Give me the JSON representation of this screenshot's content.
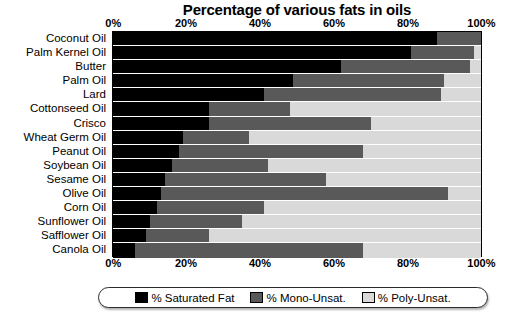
{
  "chart_data": {
    "type": "bar",
    "orientation": "horizontal",
    "stacked": true,
    "percent_stacked": true,
    "title": "Percentage of various fats in oils",
    "xlabel": "",
    "ylabel": "",
    "xlim": [
      0,
      100
    ],
    "grid": true,
    "legend_position": "bottom",
    "xticks": [
      "0%",
      "20%",
      "40%",
      "60%",
      "80%",
      "100%"
    ],
    "xtick_values": [
      0,
      20,
      40,
      60,
      80,
      100
    ],
    "categories": [
      "Coconut Oil",
      "Palm Kernel Oil",
      "Butter",
      "Palm Oil",
      "Lard",
      "Cottonseed Oil",
      "Crisco",
      "Wheat Germ Oil",
      "Peanut Oil",
      "Soybean Oil",
      "Sesame Oil",
      "Olive Oil",
      "Corn Oil",
      "Sunflower Oil",
      "Safflower Oil",
      "Canola Oil"
    ],
    "series": [
      {
        "name": "% Saturated Fat",
        "color": "#000000",
        "values": [
          88,
          81,
          62,
          49,
          41,
          26,
          26,
          19,
          18,
          16,
          14,
          13,
          12,
          10,
          9,
          6
        ]
      },
      {
        "name": "% Mono-Unsat.",
        "color": "#595959",
        "values": [
          12,
          17,
          35,
          41,
          48,
          22,
          44,
          18,
          50,
          26,
          44,
          78,
          29,
          25,
          17,
          62
        ]
      },
      {
        "name": "% Poly-Unsat.",
        "color": "#d9d9d9",
        "values": [
          0,
          2,
          3,
          10,
          11,
          52,
          30,
          63,
          32,
          58,
          42,
          9,
          59,
          65,
          74,
          32
        ]
      }
    ]
  },
  "legend": {
    "items": [
      {
        "label": "% Saturated Fat",
        "color": "#000000"
      },
      {
        "label": "% Mono-Unsat.",
        "color": "#595959"
      },
      {
        "label": "% Poly-Unsat.",
        "color": "#d9d9d9"
      }
    ]
  },
  "colors": {
    "saturated": "#000000",
    "mono": "#595959",
    "poly": "#d9d9d9",
    "axis": "#000000",
    "background": "#ffffff"
  }
}
